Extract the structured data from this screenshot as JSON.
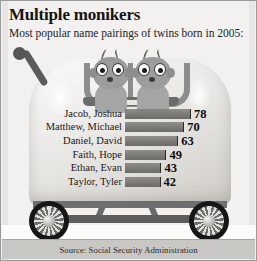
{
  "header": {
    "title": "Multiple monikers",
    "subtitle": "Most popular name pairings of twins born in 2005:"
  },
  "illustration": {
    "name": "baby-stroller-with-twins",
    "parts": {
      "handle": "stroller-handle",
      "body": "stroller-body",
      "seat": "stroller-seat-frame",
      "wheel_left": "wheel-left",
      "wheel_right": "wheel-right",
      "baby_left": "baby-face-left",
      "baby_right": "baby-face-right"
    }
  },
  "source": {
    "text": "Source: Social Security Administration"
  },
  "chart_data": {
    "type": "bar",
    "title": "Multiple monikers",
    "subtitle": "Most popular name pairings of twins born in 2005:",
    "orientation": "horizontal",
    "categories": [
      "Jacob, Joshua",
      "Matthew, Michael",
      "Daniel, David",
      "Faith, Hope",
      "Ethan, Evan",
      "Taylor, Tyler"
    ],
    "values": [
      78,
      70,
      63,
      49,
      43,
      42
    ],
    "xlabel": "",
    "ylabel": "",
    "xlim": [
      0,
      78
    ],
    "grid": false,
    "legend": null,
    "bar_color": "#7c7a76",
    "source": "Source: Social Security Administration"
  }
}
